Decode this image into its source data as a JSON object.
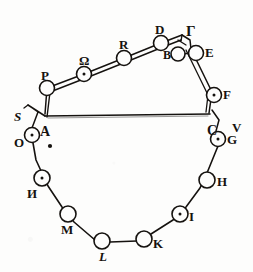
{
  "figure": {
    "ink_color": "#15120f",
    "background_color": "#fdfdfc",
    "stroke_width": 1.5
  },
  "nodes": [
    {
      "id": "P",
      "label": "P",
      "cx": 47,
      "cy": 88,
      "r": 7.5,
      "label_dx": -6,
      "label_dy": -19,
      "size": 13,
      "italic": false,
      "dot": false
    },
    {
      "id": "Omega",
      "label": "Ω",
      "cx": 84,
      "cy": 74,
      "r": 7.5,
      "label_dx": -5,
      "label_dy": -20,
      "size": 13,
      "italic": false,
      "dot": true
    },
    {
      "id": "R",
      "label": "R",
      "cx": 124,
      "cy": 58,
      "r": 7.5,
      "label_dx": -5,
      "label_dy": -20,
      "size": 13,
      "italic": false,
      "dot": false
    },
    {
      "id": "D",
      "label": "D",
      "cx": 161,
      "cy": 43,
      "r": 7.5,
      "label_dx": -6,
      "label_dy": -20,
      "size": 13,
      "italic": false,
      "dot": false
    },
    {
      "id": "B",
      "label": "B",
      "cx": 178,
      "cy": 54,
      "r": 7.0,
      "label_dx": -15,
      "label_dy": -5,
      "size": 12,
      "italic": false,
      "dot": false
    },
    {
      "id": "E",
      "label": "E",
      "cx": 196,
      "cy": 53,
      "r": 7.5,
      "label_dx": 9,
      "label_dy": -7,
      "size": 13,
      "italic": false,
      "dot": false
    },
    {
      "id": "F",
      "label": "F",
      "cx": 214,
      "cy": 95,
      "r": 7.5,
      "label_dx": 9,
      "label_dy": -7,
      "size": 13,
      "italic": false,
      "dot": true
    },
    {
      "id": "G",
      "label": "G",
      "cx": 218,
      "cy": 139,
      "r": 7.5,
      "label_dx": 9,
      "label_dy": -6,
      "size": 13,
      "italic": false,
      "dot": true
    },
    {
      "id": "H",
      "label": "H",
      "cx": 207,
      "cy": 180,
      "r": 8.0,
      "label_dx": 10,
      "label_dy": -5,
      "size": 13,
      "italic": false,
      "dot": false
    },
    {
      "id": "I",
      "label": "I",
      "cx": 180,
      "cy": 214,
      "r": 8.0,
      "label_dx": 9,
      "label_dy": -4,
      "size": 13,
      "italic": false,
      "dot": true
    },
    {
      "id": "K",
      "label": "K",
      "cx": 144,
      "cy": 239,
      "r": 8.0,
      "label_dx": 9,
      "label_dy": -2,
      "size": 13,
      "italic": false,
      "dot": false
    },
    {
      "id": "L",
      "label": "L",
      "cx": 102,
      "cy": 241,
      "r": 8.0,
      "label_dx": -3,
      "label_dy": 9,
      "size": 13,
      "italic": true,
      "dot": false
    },
    {
      "id": "M",
      "label": "M",
      "cx": 68,
      "cy": 214,
      "r": 8.0,
      "label_dx": -7,
      "label_dy": 9,
      "size": 13,
      "italic": false,
      "dot": false
    },
    {
      "id": "N",
      "label": "И",
      "cx": 42,
      "cy": 178,
      "r": 8.0,
      "label_dx": -15,
      "label_dy": 9,
      "size": 13,
      "italic": false,
      "dot": true
    },
    {
      "id": "O",
      "label": "O",
      "cx": 32,
      "cy": 135,
      "r": 7.5,
      "label_dx": -18,
      "label_dy": 1,
      "size": 13,
      "italic": false,
      "dot": true
    }
  ],
  "vertices": [
    {
      "id": "Gamma",
      "label": "Γ",
      "x": 186,
      "y": 24,
      "size": 15,
      "italic": false
    },
    {
      "id": "A",
      "label": "A",
      "x": 40,
      "y": 125,
      "size": 14,
      "italic": false
    },
    {
      "id": "C",
      "label": "C",
      "x": 207,
      "y": 124,
      "size": 14,
      "italic": false
    },
    {
      "id": "S",
      "label": "S",
      "x": 14,
      "y": 110,
      "size": 13,
      "italic": true
    },
    {
      "id": "V",
      "label": "V",
      "x": 232,
      "y": 121,
      "size": 13,
      "italic": false
    }
  ],
  "paths": {
    "triangle_base_label": "A-C baseline",
    "upper_chain_label": "A-Gamma upper chain",
    "right_chain_label": "Gamma-C right chain",
    "lower_loop_label": "A-O-N-M-L-K-I-H-G-C lower loop"
  },
  "marks": [
    {
      "id": "center-dot",
      "cx": 50,
      "cy": 146,
      "r": 2.1
    }
  ]
}
